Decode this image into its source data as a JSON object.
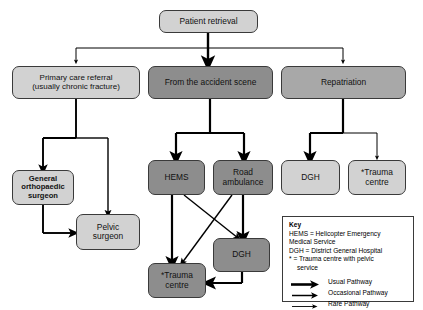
{
  "diagram": {
    "colors": {
      "fill_light": "#d2d2d2",
      "fill_mid": "#a8a8a8",
      "fill_dark": "#8d8d8d",
      "stroke": "#3a3a3a",
      "line": "#000000",
      "background": "#ffffff"
    },
    "nodes": {
      "patient_retrieval": "Patient retrieval",
      "primary_care_line1": "Primary care referral",
      "primary_care_line2": "(usually chronic fracture)",
      "accident_scene": "From the accident scene",
      "repatriation": "Repatriation",
      "general_ortho_line1": "General",
      "general_ortho_line2": "orthopaedic",
      "general_ortho_line3": "surgeon",
      "pelvic_line1": "Pelvic",
      "pelvic_line2": "surgeon",
      "hems": "HEMS",
      "road_amb_line1": "Road",
      "road_amb_line2": "ambulance",
      "dgh_repat": "DGH",
      "trauma_repat_line1": "*Trauma",
      "trauma_repat_line2": "centre",
      "dgh_lower": "DGH",
      "trauma_lower_line1": "*Trauma",
      "trauma_lower_line2": "centre"
    },
    "key": {
      "title": "Key",
      "lines": [
        "HEMS = Helicopter Emergency",
        "Medical Service",
        "DGH = District General Hospital",
        "* = Trauma centre with pelvic"
      ],
      "indented_line": "service",
      "legend": [
        {
          "label": "Usual Pathway",
          "weight": "thick"
        },
        {
          "label": "Occasional Pathway",
          "weight": "medium"
        },
        {
          "label": "Rare Pathway",
          "weight": "thin"
        }
      ]
    }
  }
}
